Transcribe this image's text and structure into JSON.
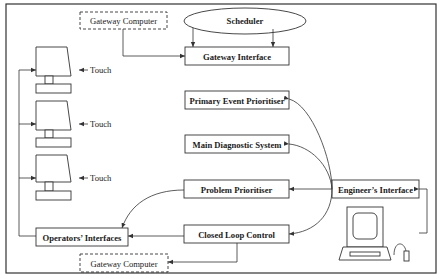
{
  "diagram": {
    "nodes": {
      "gateway_computer_top": "Gateway Computer",
      "scheduler": "Scheduler",
      "gateway_interface": "Gateway Interface",
      "primary_event_prioritiser": "Primary Event Prioritiser",
      "main_diagnostic_system": "Main Diagnostic System",
      "problem_prioritiser": "Problem Prioritiser",
      "engineers_interface": "Engineer’s Interface",
      "operators_interfaces": "Operators’ Interfaces",
      "closed_loop_control": "Closed Loop Control",
      "gateway_computer_bottom": "Gateway Computer"
    },
    "terminals": [
      {
        "label": "Touch",
        "icon": "touch-screen-terminal-icon"
      },
      {
        "label": "Touch",
        "icon": "touch-screen-terminal-icon"
      },
      {
        "label": "Touch",
        "icon": "touch-screen-terminal-icon"
      }
    ],
    "workstation_icon": "engineer-workstation-icon",
    "edges": [
      {
        "from": "Gateway Computer",
        "to": "Gateway Interface"
      },
      {
        "from": "Scheduler",
        "to": "Gateway Interface"
      },
      {
        "from": "Engineer’s Interface",
        "to": "Primary Event Prioritiser"
      },
      {
        "from": "Engineer’s Interface",
        "to": "Main Diagnostic System"
      },
      {
        "from": "Engineer’s Interface",
        "to": "Problem Prioritiser"
      },
      {
        "from": "Engineer’s Interface",
        "to": "Closed Loop Control"
      },
      {
        "from": "Problem Prioritiser",
        "to": "Operators’ Interfaces"
      },
      {
        "from": "Closed Loop Control",
        "to": "Operators’ Interfaces"
      },
      {
        "from": "Closed Loop Control",
        "to": "Gateway Computer"
      },
      {
        "from": "Operators’ Interfaces",
        "to": "Touch terminals"
      },
      {
        "from": "Engineer’s workstation",
        "to": "Engineer’s Interface"
      }
    ]
  }
}
